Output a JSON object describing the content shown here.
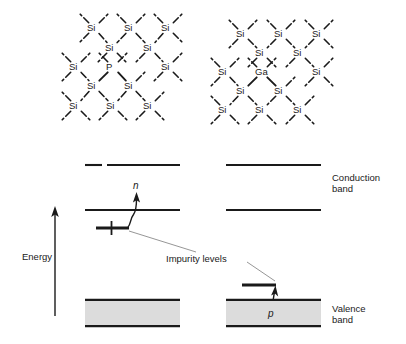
{
  "figure": {
    "type": "diagram"
  },
  "lattices": [
    {
      "name": "n-type-lattice",
      "dopant": "P",
      "host_atom": "Si",
      "atoms": [
        {
          "label": "Si",
          "x": 94,
          "y": 28
        },
        {
          "label": "Si",
          "x": 131,
          "y": 28
        },
        {
          "label": "Si",
          "x": 168,
          "y": 28
        },
        {
          "label": "Si",
          "x": 112,
          "y": 48
        },
        {
          "label": "Si",
          "x": 150,
          "y": 48
        },
        {
          "label": "Si",
          "x": 76,
          "y": 67
        },
        {
          "label": "P",
          "x": 113,
          "y": 67
        },
        {
          "label": "Si",
          "x": 168,
          "y": 67
        },
        {
          "label": "Si",
          "x": 94,
          "y": 86
        },
        {
          "label": "Si",
          "x": 131,
          "y": 86
        },
        {
          "label": "Si",
          "x": 76,
          "y": 106
        },
        {
          "label": "Si",
          "x": 113,
          "y": 106
        },
        {
          "label": "Si",
          "x": 150,
          "y": 106
        }
      ]
    },
    {
      "name": "p-type-lattice",
      "dopant": "Ga",
      "host_atom": "Si",
      "atoms": [
        {
          "label": "Si",
          "x": 243,
          "y": 34
        },
        {
          "label": "Si",
          "x": 281,
          "y": 34
        },
        {
          "label": "Si",
          "x": 319,
          "y": 34
        },
        {
          "label": "Si",
          "x": 262,
          "y": 53
        },
        {
          "label": "Si",
          "x": 300,
          "y": 53
        },
        {
          "label": "Si",
          "x": 225,
          "y": 72
        },
        {
          "label": "Ga",
          "x": 262,
          "y": 72
        },
        {
          "label": "Si",
          "x": 319,
          "y": 72
        },
        {
          "label": "Si",
          "x": 243,
          "y": 91
        },
        {
          "label": "Si",
          "x": 281,
          "y": 91
        },
        {
          "label": "Si",
          "x": 225,
          "y": 110
        },
        {
          "label": "Si",
          "x": 262,
          "y": 110
        },
        {
          "label": "Si",
          "x": 300,
          "y": 110
        }
      ]
    }
  ],
  "band_diagram": {
    "axis": {
      "label": "Energy",
      "direction": "up"
    },
    "labels": {
      "conduction_band": "Conduction\nband",
      "valence_band": "Valence\nband",
      "impurity_levels": "Impurity levels",
      "electron_carrier": "n",
      "hole_carrier": "p"
    },
    "n_type": {
      "upper_conduction_edge_y": 165,
      "conduction_band_edge_y": 210,
      "donor_level_y": 228,
      "valence_band_top_y": 299,
      "valence_band_bottom_y": 327,
      "carrier": "n"
    },
    "p_type": {
      "upper_conduction_edge_y": 165,
      "conduction_band_edge_y": 210,
      "acceptor_level_y": 285,
      "valence_band_top_y": 299,
      "valence_band_bottom_y": 327,
      "carrier": "p"
    },
    "colors": {
      "line": "#1a1a1a",
      "valence_fill": "#dcdcdc",
      "leader_line": "#8a8a8a"
    }
  }
}
